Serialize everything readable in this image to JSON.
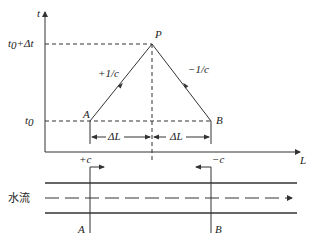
{
  "diagram": {
    "type": "time-distance characteristic diagram with channel flow sketch",
    "axes": {
      "y_label": "t",
      "x_label": "L",
      "y_ticks": [
        "t0+Δt",
        "t0"
      ]
    },
    "points": {
      "A": "A",
      "B": "B",
      "P": "P"
    },
    "slopes": {
      "left": "+1/c",
      "right": "−1/c"
    },
    "spans": {
      "left": "ΔL",
      "right": "ΔL"
    },
    "channel": {
      "flow_label": "水流",
      "wave_left": "+c",
      "wave_right": "−c",
      "section_left": "A",
      "section_right": "B"
    }
  }
}
